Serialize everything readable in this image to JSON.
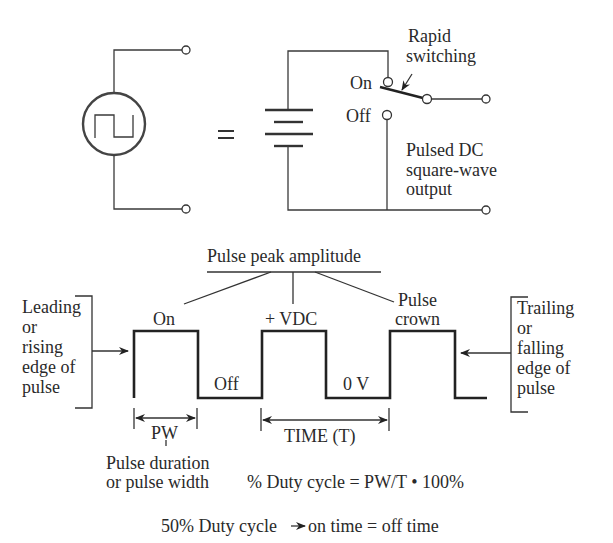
{
  "circuit": {
    "source_symbol": "square-wave-source",
    "equals": "=",
    "switch_label": [
      "Rapid",
      "switching"
    ],
    "on_label": "On",
    "off_label": "Off",
    "output_label": [
      "Pulsed DC",
      "square-wave",
      "output"
    ]
  },
  "waveform": {
    "title": "Pulse peak amplitude",
    "on_label": "On",
    "off_label": "Off",
    "vdc_label": "+ VDC",
    "zero_label": "0 V",
    "crown_label": [
      "Pulse",
      "crown"
    ],
    "leading_label": [
      "Leading",
      "or",
      "rising",
      "edge of",
      "pulse"
    ],
    "trailing_label": [
      "Trailing",
      "or",
      "falling",
      "edge of",
      "pulse"
    ],
    "pw_label": "PW",
    "time_label": "TIME (T)",
    "pw_description": [
      "Pulse duration",
      "or pulse width"
    ],
    "duty_formula": "% Duty cycle = PW/T • 100%",
    "duty_note_left": "50% Duty cycle",
    "duty_note_right": "on time = off time"
  }
}
